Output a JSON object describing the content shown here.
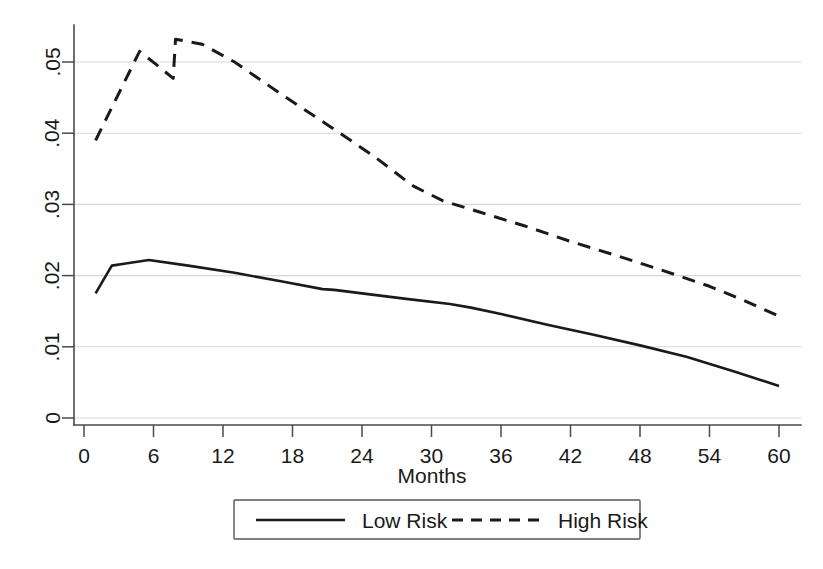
{
  "chart_data": {
    "type": "line",
    "title": "",
    "subtitle": "",
    "xlabel": "Months",
    "ylabel": "",
    "xlim": [
      0,
      60
    ],
    "ylim": [
      0,
      0.055
    ],
    "grid": true,
    "grid_axis": "y",
    "legend_position": "bottom",
    "x_ticks": [
      0,
      6,
      12,
      18,
      24,
      30,
      36,
      42,
      48,
      54,
      60
    ],
    "x_tick_labels": [
      "0",
      "6",
      "12",
      "18",
      "24",
      "30",
      "36",
      "42",
      "48",
      "54",
      "60"
    ],
    "y_ticks": [
      0,
      0.01,
      0.02,
      0.03,
      0.04,
      0.05
    ],
    "y_tick_labels": [
      "0",
      ".01",
      ".02",
      ".03",
      ".04",
      ".05"
    ],
    "series": [
      {
        "name": "Low Risk",
        "style": "solid",
        "color": "#1a1a1a",
        "x": [
          1.0,
          2.4,
          3.6,
          5.6,
          9.0,
          13.0,
          17.0,
          20.6,
          21.6,
          24.0,
          28.0,
          31.6,
          33.4,
          36.0,
          40.0,
          44.0,
          48.0,
          52.0,
          56.0,
          60.0
        ],
        "y": [
          0.0175,
          0.0214,
          0.0217,
          0.0222,
          0.0214,
          0.0204,
          0.0192,
          0.0181,
          0.018,
          0.0175,
          0.0167,
          0.016,
          0.0155,
          0.0146,
          0.0131,
          0.0117,
          0.0102,
          0.0086,
          0.0066,
          0.0045
        ]
      },
      {
        "name": "High Risk",
        "style": "dashed",
        "color": "#1a1a1a",
        "x": [
          1.0,
          4.8,
          6.2,
          7.7,
          7.9,
          10.2,
          13.0,
          17.0,
          21.0,
          25.0,
          28.4,
          31.0,
          34.0,
          38.0,
          42.0,
          46.0,
          50.0,
          54.0,
          57.0,
          60.0
        ],
        "y": [
          0.039,
          0.0515,
          0.0497,
          0.0477,
          0.0532,
          0.0525,
          0.05,
          0.0455,
          0.0412,
          0.0368,
          0.0326,
          0.0305,
          0.029,
          0.027,
          0.0248,
          0.0228,
          0.0207,
          0.0185,
          0.0165,
          0.0143
        ]
      }
    ]
  },
  "legend": {
    "entries": [
      {
        "label": "Low Risk",
        "style": "solid"
      },
      {
        "label": "High Risk",
        "style": "dashed"
      }
    ]
  },
  "axes": {
    "x_title": "Months"
  }
}
